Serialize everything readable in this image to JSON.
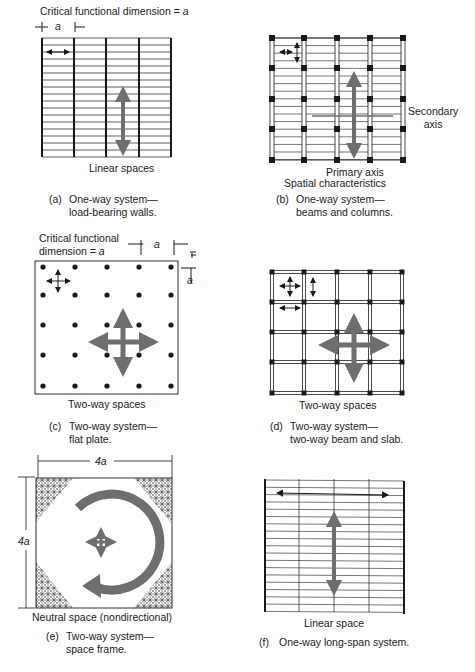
{
  "panels": [
    {
      "id": "a",
      "dimension_label": "Critical functional dimension = ",
      "dimension_var": "a",
      "tick_label": "a",
      "space_label": "Linear spaces",
      "caption_letter": "(a)",
      "caption_line1": "One-way system—",
      "caption_line2": "load-bearing walls."
    },
    {
      "id": "b",
      "secondary_axis_label_1": "Secondary",
      "secondary_axis_label_2": "axis",
      "primary_axis_label": "Primary axis",
      "space_label": "Spatial characteristics",
      "caption_letter": "(b)",
      "caption_line1": "One-way system—",
      "caption_line2": "beams and columns."
    },
    {
      "id": "c",
      "dimension_label_1": "Critical functional",
      "dimension_label_2": "dimension = ",
      "dimension_var": "a",
      "tick_label_h": "a",
      "tick_label_v": "a",
      "space_label": "Two-way spaces",
      "caption_letter": "(c)",
      "caption_line1": "Two-way system—",
      "caption_line2": "flat plate."
    },
    {
      "id": "d",
      "space_label": "Two-way spaces",
      "caption_letter": "(d)",
      "caption_line1": "Two-way system—",
      "caption_line2": "two-way beam and slab."
    },
    {
      "id": "e",
      "width_label": "4a",
      "height_label": "4a",
      "space_label": "Neutral space (nondirectional)",
      "caption_letter": "(e)",
      "caption_line1": "Two-way system—",
      "caption_line2": "space frame."
    },
    {
      "id": "f",
      "space_label": "Linear space",
      "caption_letter": "(f)",
      "caption_line1": "One-way long-span system."
    }
  ],
  "colors": {
    "ink": "#1a1a1a",
    "arrow_gray": "#6e6e6e",
    "background": "#ffffff"
  }
}
